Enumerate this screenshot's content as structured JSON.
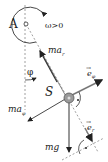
{
  "diagram": {
    "type": "physical-pendulum-forces",
    "labels": {
      "pivot": "A",
      "omega": "ω>0",
      "center": "S",
      "angle": "φ",
      "ma_r": "ma",
      "ma_r_sub": "r",
      "ma_phi": "ma",
      "ma_phi_sub": "φ",
      "mg": "mg",
      "e_phi": "e",
      "e_phi_sub": "φ",
      "e_r": "e",
      "e_r_sub": "r",
      "vec_arrow": "→"
    },
    "colors": {
      "line": "#333333",
      "dashed": "#888888",
      "body": "#9a9a9a",
      "text": "#222222"
    }
  }
}
